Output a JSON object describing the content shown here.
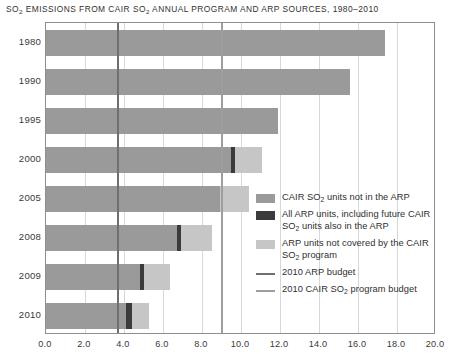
{
  "title": {
    "pre": "SO",
    "sub": "2",
    "post": " EMISSIONS FROM CAIR SO",
    "sub2": "2",
    "post2": " ANNUAL PROGRAM AND ARP SOURCES, 1980–2010"
  },
  "colors": {
    "cair_not_in_arp": "#9a9a9a",
    "all_arp_units": "#3b3b3b",
    "arp_not_covered": "#c6c6c6",
    "arp_budget_line": "#6f6f6f",
    "cair_budget_line": "#9e9e9e",
    "gridline": "#d8d8d8",
    "frame": "#8e8e8e",
    "text": "#2f2f2f"
  },
  "legend": {
    "items": [
      {
        "swatch": "cair_not_in_arp",
        "type": "box",
        "text_pre": "CAIR SO",
        "text_sub": "2",
        "text_post": " units not in the ARP"
      },
      {
        "swatch": "all_arp_units",
        "type": "box",
        "text_pre": "All ARP units, including future CAIR SO",
        "text_sub": "2",
        "text_post": " units also in the ARP"
      },
      {
        "swatch": "arp_not_covered",
        "type": "box",
        "text_pre": "ARP units not covered by the CAIR SO",
        "text_sub": "2",
        "text_post": " program"
      },
      {
        "swatch": "arp_budget_line",
        "type": "line",
        "text_pre": "2010 ARP budget",
        "text_sub": "",
        "text_post": ""
      },
      {
        "swatch": "cair_budget_line",
        "type": "line",
        "text_pre": "2010 CAIR SO",
        "text_sub": "2",
        "text_post": " program budget"
      }
    ]
  },
  "chart_data": {
    "type": "bar",
    "orientation": "horizontal",
    "stacked": true,
    "title": "SO2 EMISSIONS FROM CAIR SO2 ANNUAL PROGRAM AND ARP SOURCES, 1980–2010",
    "xlabel": "",
    "ylabel": "",
    "xlim": [
      0.0,
      20.0
    ],
    "xticks": [
      "0.0",
      "2.0",
      "4.0",
      "6.0",
      "8.0",
      "10.0",
      "12.0",
      "14.0",
      "16.0",
      "18.0",
      "20.0"
    ],
    "xtick_values": [
      0,
      2,
      4,
      6,
      8,
      10,
      12,
      14,
      16,
      18,
      20
    ],
    "grid": true,
    "legend_position": "inside-right",
    "categories": [
      "1980",
      "1990",
      "1995",
      "2000",
      "2005",
      "2008",
      "2009",
      "2010"
    ],
    "series": [
      {
        "name": "CAIR SO2 units not in the ARP",
        "color_key": "cair_not_in_arp",
        "values": [
          17.4,
          15.6,
          11.9,
          9.5,
          8.9,
          6.7,
          4.8,
          4.1
        ]
      },
      {
        "name": "All ARP units, including future CAIR SO2 units also in the ARP",
        "color_key": "all_arp_units",
        "values": [
          0.0,
          0.0,
          0.0,
          0.2,
          0.0,
          0.2,
          0.25,
          0.3
        ]
      },
      {
        "name": "ARP units not covered by the CAIR SO2 program",
        "color_key": "arp_not_covered",
        "values": [
          0.0,
          0.0,
          0.0,
          1.4,
          1.5,
          1.6,
          1.3,
          0.9
        ]
      }
    ],
    "totals": [
      17.4,
      15.6,
      11.9,
      11.1,
      10.4,
      8.5,
      6.35,
      5.3
    ],
    "reference_lines": [
      {
        "name": "2010 ARP budget",
        "value": 3.7,
        "color_key": "arp_budget_line"
      },
      {
        "name": "2010 CAIR SO2 program budget",
        "value": 9.0,
        "color_key": "cair_budget_line"
      }
    ]
  }
}
